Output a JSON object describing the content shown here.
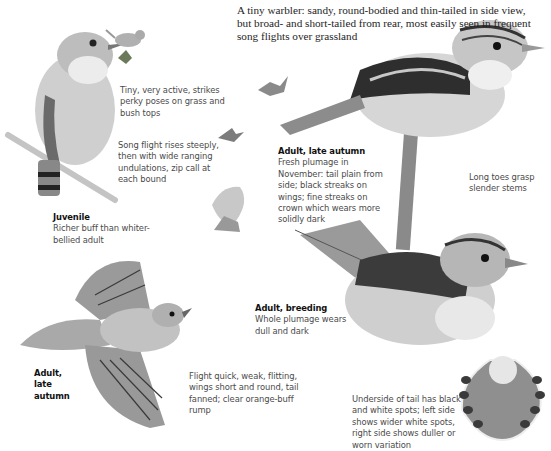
{
  "intro": "A tiny warbler: sandy, round-bodied and thin-tailed in side view, but broad- and short-tailed from rear, most easily seen in frequent song flights over grassland",
  "captions": {
    "perky": "Tiny, very active, strikes perky poses on grass and bush tops",
    "song_flight": "Song flight rises steeply, then with wide ranging undulations, zip call at each bound",
    "juvenile": {
      "title": "Juvenile",
      "text": "Richer buff than whiter-bellied adult"
    },
    "adult_late_autumn_perched": {
      "title": "Adult, late autumn",
      "text": "Fresh plumage in November: tail plain from side; black streaks on wings; fine streaks on crown which wears more solidly dark"
    },
    "toes": "Long toes grasp slender stems",
    "adult_breeding": {
      "title": "Adult, breeding",
      "text": "Whole plumage wears dull and dark"
    },
    "adult_late_autumn_flight": {
      "title": "Adult, late autumn"
    },
    "flight": "Flight quick, weak, flitting, wings short and round, tail fanned; clear orange-buff rump",
    "tail": "Underside of tail has black and white spots; left side shows wider white spots, right side shows duller or worn variation"
  },
  "colors": {
    "bird_light": "#d9d9d9",
    "bird_mid": "#a8a8a8",
    "bird_dark": "#3a3a3a",
    "stem": "#bdbdbd"
  }
}
